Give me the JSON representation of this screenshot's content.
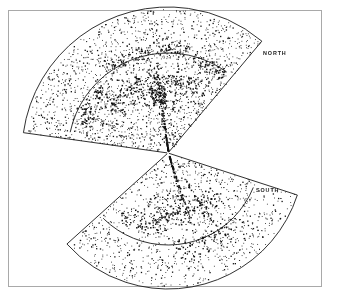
{
  "figure": {
    "title": "",
    "background_color": "#ffffff",
    "frame_color": "#a9a9a9",
    "point_color": "#111111",
    "line_color": "#1a1a1a"
  },
  "labels": {
    "north": "NORTH",
    "south": "SOUTH"
  },
  "chart_data": {
    "type": "scatter",
    "title": "",
    "subtitle": "",
    "xlabel": "",
    "ylabel": "",
    "grid": false,
    "legend_position": "none",
    "axis_ranges_shown": false,
    "tick_labels": [],
    "annotations": [
      {
        "text": "NORTH",
        "x": 263,
        "y": 53
      },
      {
        "text": "SOUTH",
        "x": 256,
        "y": 190
      }
    ],
    "series": [
      {
        "name": "NORTH galaxies",
        "point_count": 1850,
        "label": "NORTH"
      },
      {
        "name": "SOUTH galaxies",
        "point_count": 1050,
        "label": "SOUTH"
      }
    ],
    "geometry": {
      "apex_x": 168,
      "apex_y": 153,
      "north": {
        "label": "NORTH",
        "outer_radius": 146,
        "inner_radius": 100,
        "start_angle_deg": 188,
        "end_angle_deg": 310,
        "point_count": 1850
      },
      "south": {
        "label": "SOUTH",
        "outer_radius": 136,
        "inner_radius": 92,
        "start_angle_deg": 18,
        "end_angle_deg": 138,
        "point_count": 1050
      }
    },
    "filaments": {
      "north": [
        {
          "name": "great-wall-arc",
          "a0": 215,
          "a1": 295,
          "r": 74,
          "spread": 9,
          "density": 190
        },
        {
          "name": "upper-filament",
          "a0": 232,
          "a1": 282,
          "r": 104,
          "spread": 8,
          "density": 130
        },
        {
          "name": "left-filament",
          "a0": 196,
          "a1": 228,
          "r": 92,
          "spread": 10,
          "density": 85
        },
        {
          "name": "right-filament",
          "a0": 284,
          "a1": 306,
          "r": 96,
          "spread": 9,
          "density": 70
        },
        {
          "name": "core-cluster",
          "a0": 252,
          "a1": 268,
          "r": 58,
          "spread": 12,
          "density": 120
        }
      ],
      "south": [
        {
          "name": "south-wall",
          "a0": 38,
          "a1": 104,
          "r": 62,
          "spread": 10,
          "density": 160
        },
        {
          "name": "south-arm",
          "a0": 46,
          "a1": 86,
          "r": 96,
          "spread": 11,
          "density": 95
        },
        {
          "name": "south-left",
          "a0": 96,
          "a1": 128,
          "r": 74,
          "spread": 10,
          "density": 55
        }
      ]
    },
    "fingers_of_god": [
      {
        "region": "north",
        "angle_deg": 262,
        "r0": 12,
        "r1": 96,
        "count": 46
      },
      {
        "region": "north",
        "angle_deg": 247,
        "r0": 40,
        "r1": 92,
        "count": 26
      },
      {
        "region": "north",
        "angle_deg": 276,
        "r0": 44,
        "r1": 98,
        "count": 24
      },
      {
        "region": "north",
        "angle_deg": 222,
        "r0": 52,
        "r1": 98,
        "count": 20
      },
      {
        "region": "north",
        "angle_deg": 300,
        "r0": 58,
        "r1": 104,
        "count": 18
      },
      {
        "region": "north",
        "angle_deg": 205,
        "r0": 62,
        "r1": 100,
        "count": 14
      },
      {
        "region": "south",
        "angle_deg": 72,
        "r0": 10,
        "r1": 74,
        "count": 34
      },
      {
        "region": "south",
        "angle_deg": 58,
        "r0": 30,
        "r1": 86,
        "count": 20
      },
      {
        "region": "south",
        "angle_deg": 92,
        "r0": 36,
        "r1": 82,
        "count": 16
      },
      {
        "region": "south",
        "angle_deg": 112,
        "r0": 48,
        "r1": 88,
        "count": 12
      }
    ]
  }
}
